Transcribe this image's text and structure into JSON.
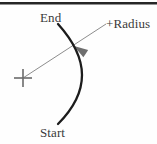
{
  "figure": {
    "background_color": "#fefefe",
    "top_rule": {
      "name": "top-rule",
      "color": "#262626",
      "x1": 0,
      "y1": 2,
      "x2": 157,
      "y2": 2,
      "width": 2.4
    },
    "labels": {
      "end": "End",
      "start": "Start",
      "radius": "+Radius"
    },
    "arc": {
      "name": "arc-path",
      "color": "#1c1c1c",
      "width": 2.3,
      "start_point": [
        58,
        24
      ],
      "end_point": [
        58,
        124
      ],
      "bulge_point": [
        82,
        75
      ],
      "path": "M 58 24 C 76 44 82 60 82 75 C 82 95 70 112 58 124"
    },
    "leader_line": {
      "name": "radius-leader-line",
      "color": "#8d8d8d",
      "width": 1,
      "from": [
        23,
        78
      ],
      "to": [
        106,
        24
      ]
    },
    "arrow_head": {
      "name": "radius-arrowhead",
      "color": "#6e6e6e",
      "tip": [
        74,
        46
      ],
      "angle_deg": 213
    },
    "center_mark": {
      "name": "arc-center-crosshair",
      "color": "#6b6b6b",
      "center": [
        23,
        78
      ],
      "arm_length": 9,
      "width": 1.6
    }
  },
  "chart_data": {
    "type": "diagram",
    "annotations": [
      "End",
      "Start",
      "+Radius"
    ],
    "elements": [
      {
        "kind": "arc",
        "label_start": "Start",
        "label_end": "End",
        "bulge_direction": "right"
      },
      {
        "kind": "center-crosshair",
        "x": 23,
        "y": 78
      },
      {
        "kind": "leader-arrow",
        "label": "+Radius",
        "from": [
          23,
          78
        ],
        "to": [
          74,
          46
        ]
      }
    ]
  }
}
